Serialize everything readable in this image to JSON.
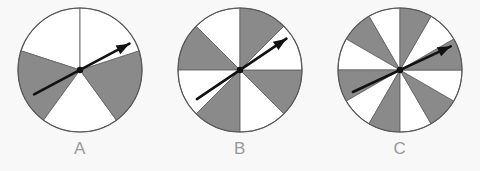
{
  "canvas": {
    "width": 480,
    "height": 171,
    "background_color": "#f8f8f8"
  },
  "style": {
    "sector_gray": "#8a8a8a",
    "sector_white": "#ffffff",
    "outline_color": "#555555",
    "divider_color": "#666666",
    "needle_color": "#111111",
    "label_color": "#9a9a9a"
  },
  "spinners": [
    {
      "id": "spinner-a",
      "label": "A",
      "sector_count": 5,
      "gray_sectors": 2,
      "white_sectors": 3,
      "center_x": 80,
      "center_y": 66,
      "radius": 62,
      "start_angle_deg": 0,
      "sector_fills": [
        "white",
        "gray",
        "white",
        "gray",
        "white"
      ],
      "needle_angle_deg": 28,
      "needle_tail_length": 52,
      "needle_head_length": 56
    },
    {
      "id": "spinner-b",
      "label": "B",
      "sector_count": 8,
      "gray_sectors": 4,
      "white_sectors": 4,
      "center_x": 80,
      "center_y": 66,
      "radius": 62,
      "start_angle_deg": 0,
      "sector_fills": [
        "white",
        "gray",
        "white",
        "gray",
        "white",
        "gray",
        "white",
        "gray"
      ],
      "needle_angle_deg": 34,
      "needle_tail_length": 52,
      "needle_head_length": 56
    },
    {
      "id": "spinner-c",
      "label": "C",
      "sector_count": 12,
      "gray_sectors": 6,
      "white_sectors": 6,
      "center_x": 80,
      "center_y": 66,
      "radius": 62,
      "start_angle_deg": 0,
      "sector_fills": [
        "white",
        "gray",
        "white",
        "gray",
        "white",
        "gray",
        "white",
        "gray",
        "white",
        "gray",
        "white",
        "gray"
      ],
      "needle_angle_deg": 25,
      "needle_tail_length": 52,
      "needle_head_length": 56
    }
  ],
  "layout": {
    "group_left_offsets": [
      0,
      160,
      320
    ]
  }
}
